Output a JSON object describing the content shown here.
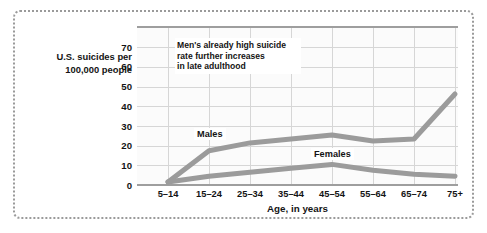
{
  "chart_data": {
    "type": "line",
    "title": "",
    "xlabel": "Age, in years",
    "ylabel": "U.S. suicides per 100,000 people",
    "ylabel_line1": "U.S. suicides per",
    "ylabel_line2": "100,000 people",
    "categories": [
      "5–14",
      "15–24",
      "25–34",
      "35–44",
      "45–54",
      "55–64",
      "65–74",
      "75+"
    ],
    "ylim": [
      0,
      78
    ],
    "yticks": [
      0,
      10,
      20,
      30,
      40,
      50,
      60,
      70
    ],
    "grid": true,
    "legend_position": "inline-labels",
    "series": [
      {
        "name": "Males",
        "color": "#9b9b9b",
        "values": [
          1,
          17,
          21,
          23,
          25,
          22,
          23,
          46
        ]
      },
      {
        "name": "Females",
        "color": "#9b9b9b",
        "values": [
          1,
          4,
          6,
          8,
          10,
          7,
          5,
          4
        ]
      }
    ],
    "annotations": [
      {
        "name": "men-late-adulthood-note",
        "line1": "Men's already high suicide",
        "line2": "rate further increases",
        "line3": "in late adulthood"
      }
    ]
  },
  "axis": {
    "y_tick_labels": [
      "70",
      "60",
      "50",
      "40",
      "30",
      "20",
      "10",
      "0"
    ],
    "x_tick_labels": [
      "5–14",
      "15–24",
      "25–34",
      "35–44",
      "45–54",
      "55–64",
      "65–74",
      "75+"
    ],
    "x_title": "Age, in years"
  },
  "series_labels": {
    "males": "Males",
    "females": "Females"
  },
  "colors": {
    "line": "#9b9b9b",
    "grid": "#d6d6d6",
    "axis": "#9e9e9e",
    "frame": "#9a9a9a",
    "text": "#141414",
    "plot_background": "#fbfbfb"
  }
}
